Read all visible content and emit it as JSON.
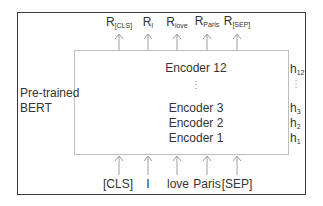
{
  "model_label": {
    "line1": "Pre-trained",
    "line2": "BERT"
  },
  "encoders": {
    "top": "Encoder 12",
    "layer3": "Encoder 3",
    "layer2": "Encoder 2",
    "layer1": "Encoder 1",
    "ellipsis": "⋮"
  },
  "hidden_states": {
    "h12": {
      "base": "h",
      "sub": "12"
    },
    "ellipsis": "⋮",
    "h3": {
      "base": "h",
      "sub": "3"
    },
    "h2": {
      "base": "h",
      "sub": "2"
    },
    "h1": {
      "base": "h",
      "sub": "1"
    }
  },
  "outputs": [
    {
      "base": "R",
      "sub": "[CLS]"
    },
    {
      "base": "R",
      "sub": "I"
    },
    {
      "base": "R",
      "sub": "love"
    },
    {
      "base": "R",
      "sub": "Paris"
    },
    {
      "base": "R",
      "sub": "[SEP]"
    }
  ],
  "inputs": [
    "[CLS]",
    "I",
    "love",
    "Paris",
    "[SEP]"
  ],
  "colors": {
    "outer_border": "#3a3a3a",
    "inner_border": "#bdbdbd",
    "arrow": "#9e9e9e",
    "text": "#333333"
  }
}
